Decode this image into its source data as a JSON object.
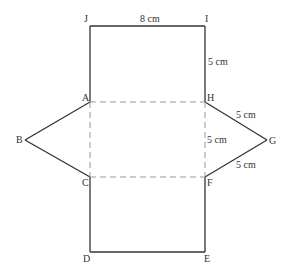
{
  "diagram": {
    "type": "net-of-triangular-prism",
    "colors": {
      "solid_line": "#333333",
      "dashed_line": "#999999",
      "text": "#333333"
    },
    "vertices": {
      "J": {
        "label": "J",
        "x": 90,
        "y": 26
      },
      "I": {
        "label": "I",
        "x": 205,
        "y": 26
      },
      "A": {
        "label": "A",
        "x": 90,
        "y": 102
      },
      "H": {
        "label": "H",
        "x": 205,
        "y": 102
      },
      "B": {
        "label": "B",
        "x": 25,
        "y": 140
      },
      "G": {
        "label": "G",
        "x": 267,
        "y": 140
      },
      "C": {
        "label": "C",
        "x": 90,
        "y": 177
      },
      "F": {
        "label": "F",
        "x": 205,
        "y": 177
      },
      "D": {
        "label": "D",
        "x": 90,
        "y": 252
      },
      "E": {
        "label": "E",
        "x": 205,
        "y": 252
      }
    },
    "measurements": {
      "JI": "8 cm",
      "IH": "5 cm",
      "HF": "5 cm",
      "HG": "5 cm",
      "FG": "5 cm"
    }
  }
}
